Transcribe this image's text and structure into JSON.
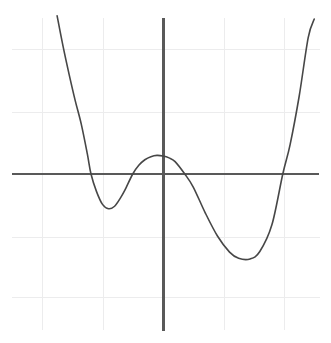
{
  "figure": {
    "background_color": "#ffffff",
    "width": 331,
    "height": 343
  },
  "style": {
    "grid_color": "#ececed",
    "axis_color": "#595959",
    "curve_color": "#474747",
    "curve_stroke_width": 1.6,
    "axis_stroke_width": 2.1,
    "grid_stroke_width": 1
  },
  "geometry": {
    "origin_px": {
      "x": 163,
      "y": 174
    },
    "unit_px": {
      "x": 60.5,
      "y": 62
    },
    "grid_extent_px": {
      "left": 12,
      "right": 320,
      "top": 18,
      "bottom": 330
    },
    "vertical_gridlines_px": [
      42,
      103,
      163,
      224,
      284
    ],
    "horizontal_gridlines_px": [
      49,
      112,
      174,
      237,
      297
    ]
  },
  "chart_data": {
    "type": "line",
    "title": "",
    "subtitle": "",
    "xlabel": "",
    "ylabel": "",
    "grid": true,
    "grid_spacing": {
      "x": 1,
      "y": 1
    },
    "legend": null,
    "legend_position": "none",
    "axis_shown": {
      "x": true,
      "y": true
    },
    "xlim": [
      -2.5,
      2.6
    ],
    "ylim": [
      -2.5,
      2.5
    ],
    "xticks": [
      -2,
      -1,
      0,
      1,
      2
    ],
    "yticks": [
      -2,
      -1,
      0,
      1,
      2
    ],
    "xticklabels": [
      "",
      "",
      "",
      "",
      ""
    ],
    "yticklabels": [
      "",
      "",
      "",
      "",
      ""
    ],
    "series": [
      {
        "name": "quartic",
        "color": "#474747",
        "x": [
          -1.75,
          -1.65,
          -1.55,
          -1.45,
          -1.35,
          -1.25,
          -1.19,
          -1.1,
          -1.0,
          -0.9,
          -0.8,
          -0.7,
          -0.63,
          -0.5,
          -0.4,
          -0.3,
          -0.2,
          -0.1,
          0.0,
          0.1,
          0.2,
          0.36,
          0.5,
          0.7,
          0.9,
          1.1,
          1.25,
          1.44,
          1.6,
          1.8,
          1.98,
          2.1,
          2.25,
          2.4,
          2.5
        ],
        "y": [
          2.55,
          2.05,
          1.6,
          1.18,
          0.8,
          0.32,
          0.0,
          -0.28,
          -0.49,
          -0.56,
          -0.52,
          -0.38,
          -0.26,
          0.0,
          0.14,
          0.23,
          0.28,
          0.3,
          0.29,
          0.26,
          0.2,
          0.0,
          -0.21,
          -0.63,
          -1.0,
          -1.26,
          -1.36,
          -1.37,
          -1.25,
          -0.82,
          0.0,
          0.47,
          1.25,
          2.2,
          2.5
        ],
        "annotations": {
          "local_maximum": {
            "x": 0.0,
            "y": 0.29
          },
          "local_minimum_left": {
            "x": -0.9,
            "y": -0.56
          },
          "local_minimum_right": {
            "x": 1.44,
            "y": -1.37
          },
          "roots": [
            -1.19,
            -0.63,
            0.36,
            1.98
          ]
        }
      }
    ]
  }
}
